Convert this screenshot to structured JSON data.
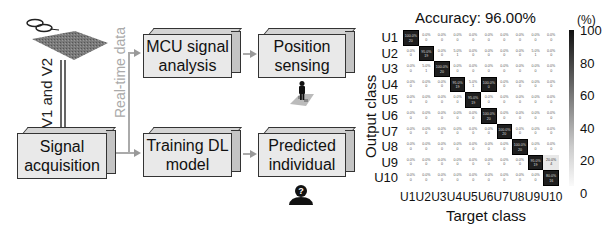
{
  "diagram": {
    "vertical_label": "V1 and V2",
    "realtime_label": "Real-time data",
    "boxes": {
      "signal_acquisition": "Signal acquisition",
      "mcu_signal_analysis": "MCU signal analysis",
      "position_sensing": "Position sensing",
      "training_dl_model": "Training DL model",
      "predicted_individual": "Predicted individual"
    },
    "icons": [
      "shoes-icon",
      "sensor-mat-icon",
      "person-on-grid-icon",
      "identified-person-icon"
    ]
  },
  "chart_data": {
    "type": "heatmap",
    "title": "Accuracy: 96.00%",
    "xlabel": "Target class",
    "ylabel": "Output class",
    "colorbar_label": "(%)",
    "colorbar_ticks": [
      100,
      80,
      60,
      40,
      20,
      0
    ],
    "row_labels": [
      "U1",
      "U2",
      "U3",
      "U4",
      "U5",
      "U6",
      "U7",
      "U8",
      "U9",
      "U10"
    ],
    "col_labels": [
      "U1",
      "U2",
      "U3",
      "U4",
      "U5",
      "U6",
      "U7",
      "U8",
      "U9",
      "U10"
    ],
    "cells_percent": [
      [
        "100.0%",
        "0.0%",
        "0.0%",
        "0.0%",
        "0.0%",
        "0.0%",
        "0.0%",
        "0.0%",
        "0.0%",
        "0.0%"
      ],
      [
        "0.0%",
        "95.0%",
        "0.0%",
        "5.0%",
        "0.0%",
        "0.0%",
        "0.0%",
        "0.0%",
        "5.0%",
        "0.0%"
      ],
      [
        "0.0%",
        "5.0%",
        "100.0%",
        "0.0%",
        "0.0%",
        "0.0%",
        "0.0%",
        "0.0%",
        "0.0%",
        "0.0%"
      ],
      [
        "0.0%",
        "0.0%",
        "0.0%",
        "95.0%",
        "5.0%",
        "100.0%",
        "0.0%",
        "0.0%",
        "0.0%",
        "0.0%"
      ],
      [
        "0.0%",
        "0.0%",
        "0.0%",
        "0.0%",
        "95.0%",
        "0.0%",
        "0.0%",
        "0.0%",
        "0.0%",
        "0.0%"
      ],
      [
        "0.0%",
        "0.0%",
        "0.0%",
        "0.0%",
        "0.0%",
        "100.0%",
        "0.0%",
        "0.0%",
        "0.0%",
        "0.0%"
      ],
      [
        "0.0%",
        "0.0%",
        "0.0%",
        "0.0%",
        "0.0%",
        "0.0%",
        "100.0%",
        "0.0%",
        "0.0%",
        "0.0%"
      ],
      [
        "0.0%",
        "0.0%",
        "0.0%",
        "0.0%",
        "0.0%",
        "0.0%",
        "0.0%",
        "100.0%",
        "0.0%",
        "0.0%"
      ],
      [
        "0.0%",
        "0.0%",
        "0.0%",
        "0.0%",
        "0.0%",
        "0.0%",
        "0.0%",
        "0.0%",
        "95.0%",
        "20.0%"
      ],
      [
        "0.0%",
        "0.0%",
        "0.0%",
        "0.0%",
        "0.0%",
        "0.0%",
        "0.0%",
        "0.0%",
        "0.0%",
        "80.0%"
      ]
    ],
    "cells_count": [
      [
        20,
        0,
        0,
        0,
        0,
        0,
        0,
        0,
        0,
        0
      ],
      [
        0,
        19,
        0,
        1,
        0,
        0,
        0,
        0,
        1,
        0
      ],
      [
        0,
        1,
        20,
        0,
        0,
        0,
        0,
        0,
        0,
        0
      ],
      [
        0,
        0,
        0,
        19,
        1,
        0,
        0,
        0,
        0,
        0
      ],
      [
        0,
        0,
        0,
        0,
        19,
        0,
        0,
        0,
        0,
        0
      ],
      [
        0,
        0,
        0,
        0,
        0,
        20,
        0,
        0,
        0,
        0
      ],
      [
        0,
        0,
        0,
        0,
        0,
        0,
        20,
        0,
        0,
        0
      ],
      [
        0,
        0,
        0,
        0,
        0,
        0,
        0,
        20,
        0,
        0
      ],
      [
        0,
        0,
        0,
        0,
        0,
        0,
        0,
        0,
        19,
        4
      ],
      [
        0,
        0,
        0,
        0,
        0,
        0,
        0,
        0,
        0,
        16
      ]
    ]
  }
}
